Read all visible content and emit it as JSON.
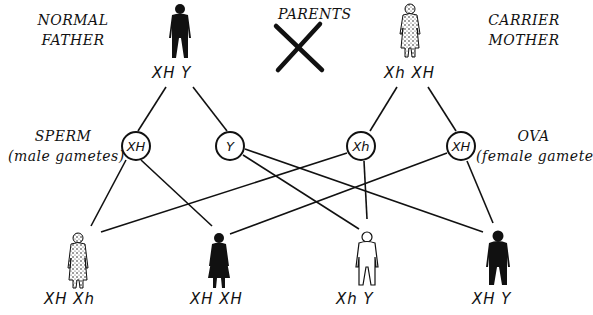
{
  "title_cross": "PARENTS",
  "parents": [
    {
      "label_line1": "NORMAL",
      "label_line2": "FATHER",
      "genotype": "XH  Y",
      "figure": "male",
      "fill": "solid"
    },
    {
      "label_line1": "CARRIER",
      "label_line2": "MOTHER",
      "genotype": "Xh  XH",
      "figure": "female",
      "fill": "stippled"
    }
  ],
  "gamete_groups": [
    {
      "label": "SPERM",
      "sublabel": "(male gametes)"
    },
    {
      "label": "OVA",
      "sublabel": "(female gametes)"
    }
  ],
  "gametes": [
    {
      "id": "sperm-xh",
      "allele": "XH",
      "source": "father"
    },
    {
      "id": "sperm-y",
      "allele": "Y",
      "source": "father"
    },
    {
      "id": "ova-xh-recessive",
      "allele": "Xh",
      "source": "mother"
    },
    {
      "id": "ova-xh-dominant",
      "allele": "XH",
      "source": "mother"
    }
  ],
  "offspring": [
    {
      "genotype": "XH  Xh",
      "figure": "female",
      "fill": "stippled",
      "parents": [
        "sperm-xh",
        "ova-xh-recessive"
      ]
    },
    {
      "genotype": "XH  XH",
      "figure": "female",
      "fill": "solid",
      "parents": [
        "sperm-xh",
        "ova-xh-dominant"
      ]
    },
    {
      "genotype": "Xh  Y",
      "figure": "male",
      "fill": "outline",
      "parents": [
        "sperm-y",
        "ova-xh-recessive"
      ]
    },
    {
      "genotype": "XH  Y",
      "figure": "male",
      "fill": "solid",
      "parents": [
        "sperm-y",
        "ova-xh-dominant"
      ]
    }
  ],
  "colors": {
    "ink": "#111111",
    "background": "#ffffff"
  },
  "icons": {
    "cross": "cross-icon",
    "male": "male-figure-icon",
    "female": "female-figure-icon"
  }
}
